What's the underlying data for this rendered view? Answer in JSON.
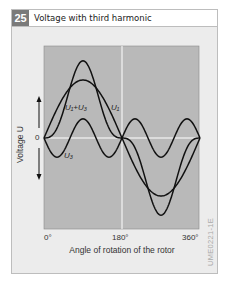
{
  "figure": {
    "number": "25",
    "title": "Voltage with third harmonic",
    "code": "UME0221-1E"
  },
  "colors": {
    "panel_bg": "#ececec",
    "plot_bg": "#b9b9b9",
    "number_badge": "#7a7a7a",
    "curve": "#111111",
    "gridline": "#ffffff"
  },
  "chart_data": {
    "type": "line",
    "title": "Voltage with third harmonic",
    "xlabel": "Angle of rotation of the rotor",
    "ylabel": "Voltage U",
    "x_ticks": [
      "0°",
      "180°",
      "360°"
    ],
    "y_ticks": [
      "0"
    ],
    "xlim": [
      0,
      360
    ],
    "grid": "vertical line at 180°, horizontal line at 0",
    "series": [
      {
        "name": "U1",
        "label": "U₁",
        "formula": "1.0·sin(θ)",
        "amplitude": 1.0
      },
      {
        "name": "U3",
        "label": "U₃",
        "formula": "-0.33·sin(3θ)",
        "amplitude": 0.33
      },
      {
        "name": "U1+U3",
        "label": "U₁+U₃",
        "formula": "sin(θ) - 0.33·sin(3θ)",
        "amplitude": 1.2
      }
    ]
  },
  "labels": {
    "u1": "U₁",
    "u3": "U₃",
    "u1u3": "U₁+U₃",
    "tick_0": "0°",
    "tick_180": "180°",
    "tick_360": "360°",
    "zero": "0",
    "xlabel": "Angle of rotation of the rotor",
    "ylabel": "Voltage U"
  }
}
